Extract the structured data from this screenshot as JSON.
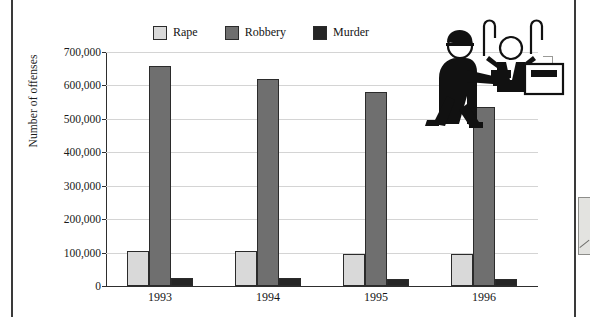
{
  "chart_data": {
    "type": "bar",
    "title": "",
    "xlabel": "",
    "ylabel": "Number of offenses",
    "categories": [
      "1993",
      "1994",
      "1995",
      "1996"
    ],
    "series": [
      {
        "name": "Rape",
        "color": "#d9d9d9",
        "values": [
          104000,
          104000,
          97000,
          96000
        ]
      },
      {
        "name": "Robbery",
        "color": "#6f6f6f",
        "values": [
          659000,
          619000,
          581000,
          537000
        ]
      },
      {
        "name": "Murder",
        "color": "#262626",
        "values": [
          25000,
          23000,
          21000,
          20000
        ]
      }
    ],
    "ylim": [
      0,
      700000
    ],
    "ytick_labels": [
      "700,000",
      "600,000",
      "500,000",
      "400,000",
      "300,000",
      "200,000",
      "100,000",
      "0"
    ],
    "ytick_values": [
      700000,
      600000,
      500000,
      400000,
      300000,
      200000,
      100000,
      0
    ],
    "grid": true,
    "legend_position": "top-center"
  },
  "legend": {
    "items": [
      {
        "label": "Rape",
        "color": "#d9d9d9",
        "icon": "legend-swatch-icon"
      },
      {
        "label": "Robbery",
        "color": "#6f6f6f",
        "icon": "legend-swatch-icon"
      },
      {
        "label": "Murder",
        "color": "#262626",
        "icon": "legend-swatch-icon"
      }
    ]
  },
  "illustration": {
    "name": "robbery-pictogram",
    "description": "Armed robber pointing handgun at cashier with hands raised behind a counter"
  }
}
